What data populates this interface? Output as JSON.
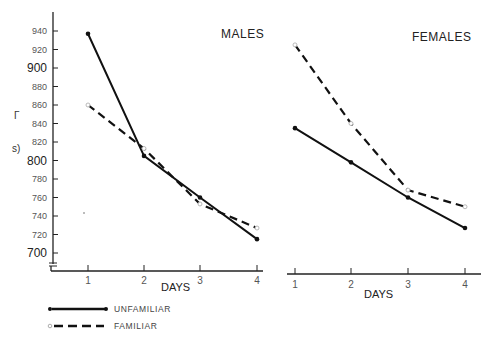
{
  "chart_data": [
    {
      "type": "line",
      "title": "MALES",
      "xlabel": "DAYS",
      "ylabel": "",
      "x": [
        1,
        2,
        3,
        4
      ],
      "ylim": [
        690,
        950
      ],
      "yticks": [
        700,
        720,
        740,
        760,
        780,
        800,
        820,
        840,
        860,
        880,
        900,
        920,
        940
      ],
      "series": [
        {
          "name": "UNFAMILIAR",
          "style": "solid",
          "marker": "filled-circle",
          "values": [
            937,
            805,
            760,
            715
          ]
        },
        {
          "name": "FAMILIAR",
          "style": "dashed",
          "marker": "open-circle",
          "values": [
            860,
            813,
            753,
            727
          ]
        }
      ]
    },
    {
      "type": "line",
      "title": "FEMALES",
      "xlabel": "DAYS",
      "ylabel": "",
      "x": [
        1,
        2,
        3,
        4
      ],
      "ylim": [
        690,
        950
      ],
      "series": [
        {
          "name": "UNFAMILIAR",
          "style": "solid",
          "marker": "filled-circle",
          "values": [
            835,
            798,
            760,
            727
          ]
        },
        {
          "name": "FAMILIAR",
          "style": "dashed",
          "marker": "open-circle",
          "values": [
            925,
            840,
            768,
            750
          ]
        }
      ]
    }
  ],
  "labels": {
    "males_title": "MALES",
    "females_title": "FEMALES",
    "x_title_left": "DAYS",
    "x_title_right": "DAYS",
    "legend_unfamiliar": "UNFAMILIAR",
    "legend_familiar": "FAMILIAR",
    "ylabel_fragment_1": "Г",
    "ylabel_fragment_2": "s)",
    "yticks": [
      "940",
      "920",
      "900",
      "880",
      "860",
      "840",
      "820",
      "800",
      "780",
      "760",
      "740",
      "720",
      "700"
    ],
    "xticks": [
      "1",
      "2",
      "3",
      "4"
    ]
  }
}
